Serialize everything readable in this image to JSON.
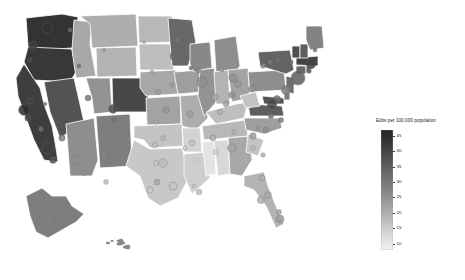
{
  "figure": {
    "background": "#ffffff",
    "width": 465,
    "height": 280
  },
  "legend": {
    "title": "Edits per 100,000 population",
    "orientation": "vertical",
    "position": "right",
    "colorbar": {
      "low_color": "#f5f5f5",
      "high_color": "#2b2b2b",
      "vmin": 8,
      "vmax": 47
    },
    "ticks": [
      {
        "value": "45",
        "pos": 0.0513
      },
      {
        "value": "40",
        "pos": 0.1795
      },
      {
        "value": "35",
        "pos": 0.3077
      },
      {
        "value": "30",
        "pos": 0.4359
      },
      {
        "value": "25",
        "pos": 0.5641
      },
      {
        "value": "20",
        "pos": 0.6923
      },
      {
        "value": "15",
        "pos": 0.8205
      },
      {
        "value": "10",
        "pos": 0.9487
      }
    ]
  },
  "chart_data": {
    "type": "heatmap",
    "title": "",
    "subtitle": "",
    "xlabel": "",
    "ylabel": "",
    "map_type": "choropleth-with-proportional-symbols",
    "region": "United States",
    "value_label": "Edits per 100,000 population",
    "value_range": [
      8,
      47
    ],
    "grid": false,
    "legend_position": "right",
    "colormap": "grays-reversed",
    "states": [
      {
        "name": "Washington",
        "value": 44
      },
      {
        "name": "Oregon",
        "value": 43
      },
      {
        "name": "California",
        "value": 42
      },
      {
        "name": "Nevada",
        "value": 38
      },
      {
        "name": "Idaho",
        "value": 22
      },
      {
        "name": "Montana",
        "value": 21
      },
      {
        "name": "Wyoming",
        "value": 20
      },
      {
        "name": "Utah",
        "value": 26
      },
      {
        "name": "Colorado",
        "value": 40
      },
      {
        "name": "Arizona",
        "value": 27
      },
      {
        "name": "New Mexico",
        "value": 30
      },
      {
        "name": "North Dakota",
        "value": 19
      },
      {
        "name": "South Dakota",
        "value": 18
      },
      {
        "name": "Nebraska",
        "value": 22
      },
      {
        "name": "Kansas",
        "value": 23
      },
      {
        "name": "Oklahoma",
        "value": 17
      },
      {
        "name": "Texas",
        "value": 16
      },
      {
        "name": "Minnesota",
        "value": 34
      },
      {
        "name": "Iowa",
        "value": 24
      },
      {
        "name": "Missouri",
        "value": 21
      },
      {
        "name": "Arkansas",
        "value": 14
      },
      {
        "name": "Louisiana",
        "value": 15
      },
      {
        "name": "Wisconsin",
        "value": 28
      },
      {
        "name": "Illinois",
        "value": 26
      },
      {
        "name": "Michigan",
        "value": 27
      },
      {
        "name": "Indiana",
        "value": 20
      },
      {
        "name": "Ohio",
        "value": 23
      },
      {
        "name": "Kentucky",
        "value": 18
      },
      {
        "name": "Tennessee",
        "value": 19
      },
      {
        "name": "Mississippi",
        "value": 11
      },
      {
        "name": "Alabama",
        "value": 13
      },
      {
        "name": "Georgia",
        "value": 22
      },
      {
        "name": "Florida",
        "value": 20
      },
      {
        "name": "South Carolina",
        "value": 17
      },
      {
        "name": "North Carolina",
        "value": 24
      },
      {
        "name": "Virginia",
        "value": 36
      },
      {
        "name": "West Virginia",
        "value": 17
      },
      {
        "name": "Maryland",
        "value": 38
      },
      {
        "name": "Delaware",
        "value": 30
      },
      {
        "name": "Pennsylvania",
        "value": 27
      },
      {
        "name": "New Jersey",
        "value": 33
      },
      {
        "name": "New York",
        "value": 35
      },
      {
        "name": "Connecticut",
        "value": 34
      },
      {
        "name": "Rhode Island",
        "value": 32
      },
      {
        "name": "Massachusetts",
        "value": 41
      },
      {
        "name": "Vermont",
        "value": 39
      },
      {
        "name": "New Hampshire",
        "value": 36
      },
      {
        "name": "Maine",
        "value": 29
      },
      {
        "name": "Alaska",
        "value": 30
      },
      {
        "name": "Hawaii",
        "value": 28
      }
    ],
    "cities": [
      {
        "name": "Seattle",
        "x": 47,
        "y": 28,
        "r": 5.2,
        "value": 44
      },
      {
        "name": "Portland",
        "x": 33,
        "y": 46,
        "r": 4.4,
        "value": 42
      },
      {
        "name": "Spokane",
        "x": 70,
        "y": 30,
        "r": 2.2,
        "value": 34
      },
      {
        "name": "Boise",
        "x": 79,
        "y": 66,
        "r": 2.0,
        "value": 33
      },
      {
        "name": "Eugene",
        "x": 30,
        "y": 60,
        "r": 2.2,
        "value": 40
      },
      {
        "name": "Sacramento",
        "x": 30,
        "y": 101,
        "r": 3.0,
        "value": 41
      },
      {
        "name": "San Francisco",
        "x": 24,
        "y": 110,
        "r": 5.4,
        "value": 45
      },
      {
        "name": "San Jose",
        "x": 28,
        "y": 118,
        "r": 3.2,
        "value": 40
      },
      {
        "name": "Fresno",
        "x": 41,
        "y": 129,
        "r": 2.4,
        "value": 33
      },
      {
        "name": "Los Angeles",
        "x": 48,
        "y": 148,
        "r": 6.0,
        "value": 42
      },
      {
        "name": "San Diego",
        "x": 53,
        "y": 160,
        "r": 3.4,
        "value": 38
      },
      {
        "name": "Las Vegas",
        "x": 62,
        "y": 138,
        "r": 3.2,
        "value": 30
      },
      {
        "name": "Reno",
        "x": 45,
        "y": 104,
        "r": 1.8,
        "value": 32
      },
      {
        "name": "Salt Lake City",
        "x": 88,
        "y": 98,
        "r": 3.0,
        "value": 31
      },
      {
        "name": "Phoenix",
        "x": 76,
        "y": 160,
        "r": 4.2,
        "value": 27
      },
      {
        "name": "Tucson",
        "x": 84,
        "y": 173,
        "r": 2.4,
        "value": 26
      },
      {
        "name": "Albuquerque",
        "x": 104,
        "y": 154,
        "r": 2.6,
        "value": 28
      },
      {
        "name": "Denver",
        "x": 113,
        "y": 109,
        "r": 4.4,
        "value": 39
      },
      {
        "name": "Colorado Springs",
        "x": 114,
        "y": 120,
        "r": 2.4,
        "value": 32
      },
      {
        "name": "El Paso",
        "x": 106,
        "y": 182,
        "r": 2.4,
        "value": 18
      },
      {
        "name": "Billings",
        "x": 104,
        "y": 50,
        "r": 1.6,
        "value": 24
      },
      {
        "name": "Bismarck",
        "x": 144,
        "y": 42,
        "r": 1.5,
        "value": 20
      },
      {
        "name": "Sioux Falls",
        "x": 152,
        "y": 72,
        "r": 1.9,
        "value": 22
      },
      {
        "name": "Omaha",
        "x": 158,
        "y": 92,
        "r": 2.6,
        "value": 24
      },
      {
        "name": "Wichita",
        "x": 156,
        "y": 122,
        "r": 2.2,
        "value": 21
      },
      {
        "name": "Kansas City",
        "x": 166,
        "y": 110,
        "r": 3.2,
        "value": 25
      },
      {
        "name": "Minneapolis",
        "x": 175,
        "y": 56,
        "r": 5.0,
        "value": 34
      },
      {
        "name": "Duluth",
        "x": 177,
        "y": 40,
        "r": 1.6,
        "value": 30
      },
      {
        "name": "Des Moines",
        "x": 172,
        "y": 85,
        "r": 2.2,
        "value": 24
      },
      {
        "name": "St. Louis",
        "x": 190,
        "y": 114,
        "r": 3.4,
        "value": 24
      },
      {
        "name": "Oklahoma City",
        "x": 155,
        "y": 145,
        "r": 2.8,
        "value": 18
      },
      {
        "name": "Tulsa",
        "x": 163,
        "y": 138,
        "r": 2.4,
        "value": 19
      },
      {
        "name": "Dallas",
        "x": 163,
        "y": 163,
        "r": 4.2,
        "value": 18
      },
      {
        "name": "Fort Worth",
        "x": 156,
        "y": 163,
        "r": 2.6,
        "value": 16
      },
      {
        "name": "Austin",
        "x": 157,
        "y": 182,
        "r": 3.0,
        "value": 22
      },
      {
        "name": "San Antonio",
        "x": 150,
        "y": 190,
        "r": 3.2,
        "value": 16
      },
      {
        "name": "Houston",
        "x": 173,
        "y": 186,
        "r": 4.0,
        "value": 17
      },
      {
        "name": "New Orleans",
        "x": 199,
        "y": 192,
        "r": 2.8,
        "value": 18
      },
      {
        "name": "Baton Rouge",
        "x": 194,
        "y": 186,
        "r": 1.8,
        "value": 15
      },
      {
        "name": "Little Rock",
        "x": 185,
        "y": 148,
        "r": 2.2,
        "value": 15
      },
      {
        "name": "Memphis",
        "x": 192,
        "y": 143,
        "r": 2.8,
        "value": 16
      },
      {
        "name": "Nashville",
        "x": 213,
        "y": 138,
        "r": 3.0,
        "value": 21
      },
      {
        "name": "Chicago",
        "x": 202,
        "y": 82,
        "r": 5.2,
        "value": 27
      },
      {
        "name": "Milwaukee",
        "x": 198,
        "y": 70,
        "r": 2.8,
        "value": 28
      },
      {
        "name": "Madison",
        "x": 191,
        "y": 68,
        "r": 2.0,
        "value": 32
      },
      {
        "name": "Indianapolis",
        "x": 215,
        "y": 97,
        "r": 3.2,
        "value": 22
      },
      {
        "name": "Detroit",
        "x": 233,
        "y": 78,
        "r": 4.2,
        "value": 26
      },
      {
        "name": "Grand Rapids",
        "x": 222,
        "y": 70,
        "r": 2.0,
        "value": 25
      },
      {
        "name": "Columbus",
        "x": 232,
        "y": 95,
        "r": 3.2,
        "value": 26
      },
      {
        "name": "Cleveland",
        "x": 238,
        "y": 84,
        "r": 3.4,
        "value": 25
      },
      {
        "name": "Cincinnati",
        "x": 226,
        "y": 104,
        "r": 2.8,
        "value": 23
      },
      {
        "name": "Louisville",
        "x": 220,
        "y": 112,
        "r": 2.6,
        "value": 20
      },
      {
        "name": "Pittsburgh",
        "x": 252,
        "y": 89,
        "r": 3.2,
        "value": 26
      },
      {
        "name": "Buffalo",
        "x": 263,
        "y": 66,
        "r": 2.4,
        "value": 28
      },
      {
        "name": "Rochester",
        "x": 270,
        "y": 62,
        "r": 2.0,
        "value": 30
      },
      {
        "name": "Syracuse",
        "x": 278,
        "y": 60,
        "r": 1.8,
        "value": 31
      },
      {
        "name": "Albany",
        "x": 291,
        "y": 62,
        "r": 2.2,
        "value": 33
      },
      {
        "name": "New York",
        "x": 298,
        "y": 78,
        "r": 7.0,
        "value": 36
      },
      {
        "name": "Newark",
        "x": 292,
        "y": 82,
        "r": 3.0,
        "value": 33
      },
      {
        "name": "Philadelphia",
        "x": 286,
        "y": 90,
        "r": 4.6,
        "value": 30
      },
      {
        "name": "Baltimore",
        "x": 277,
        "y": 99,
        "r": 3.6,
        "value": 33
      },
      {
        "name": "Washington DC",
        "x": 272,
        "y": 104,
        "r": 4.8,
        "value": 40
      },
      {
        "name": "Richmond",
        "x": 271,
        "y": 116,
        "r": 2.6,
        "value": 32
      },
      {
        "name": "Virginia Beach",
        "x": 281,
        "y": 120,
        "r": 2.6,
        "value": 30
      },
      {
        "name": "Boston",
        "x": 311,
        "y": 64,
        "r": 4.8,
        "value": 41
      },
      {
        "name": "Providence",
        "x": 309,
        "y": 71,
        "r": 2.4,
        "value": 34
      },
      {
        "name": "Hartford",
        "x": 301,
        "y": 69,
        "r": 2.2,
        "value": 34
      },
      {
        "name": "Portland ME",
        "x": 315,
        "y": 50,
        "r": 2.0,
        "value": 33
      },
      {
        "name": "Raleigh",
        "x": 266,
        "y": 130,
        "r": 3.0,
        "value": 27
      },
      {
        "name": "Charlotte",
        "x": 253,
        "y": 136,
        "r": 3.2,
        "value": 24
      },
      {
        "name": "Greensboro",
        "x": 258,
        "y": 128,
        "r": 2.0,
        "value": 25
      },
      {
        "name": "Columbia",
        "x": 253,
        "y": 148,
        "r": 2.2,
        "value": 18
      },
      {
        "name": "Charleston",
        "x": 263,
        "y": 155,
        "r": 2.2,
        "value": 20
      },
      {
        "name": "Atlanta",
        "x": 232,
        "y": 148,
        "r": 4.4,
        "value": 23
      },
      {
        "name": "Birmingham",
        "x": 216,
        "y": 152,
        "r": 2.6,
        "value": 14
      },
      {
        "name": "Jackson",
        "x": 197,
        "y": 160,
        "r": 1.9,
        "value": 11
      },
      {
        "name": "Knoxville",
        "x": 234,
        "y": 132,
        "r": 2.2,
        "value": 20
      },
      {
        "name": "Jacksonville",
        "x": 262,
        "y": 178,
        "r": 3.0,
        "value": 21
      },
      {
        "name": "Orlando",
        "x": 268,
        "y": 195,
        "r": 3.4,
        "value": 22
      },
      {
        "name": "Tampa",
        "x": 261,
        "y": 200,
        "r": 3.6,
        "value": 21
      },
      {
        "name": "Miami",
        "x": 280,
        "y": 219,
        "r": 4.0,
        "value": 24
      },
      {
        "name": "Fort Lauderdale",
        "x": 279,
        "y": 212,
        "r": 2.4,
        "value": 22
      },
      {
        "name": "Anchorage",
        "x": 55,
        "y": 218,
        "r": 2.0,
        "value": 30
      },
      {
        "name": "Honolulu",
        "x": 128,
        "y": 247,
        "r": 2.2,
        "value": 28
      }
    ]
  }
}
